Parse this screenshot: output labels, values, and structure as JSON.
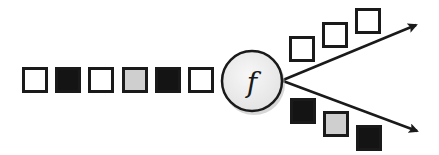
{
  "diagram": {
    "colors": {
      "white": "#ffffff",
      "black": "#141414",
      "gray": "#cfcfcf",
      "stroke": "#1a1a1a",
      "node_fill": "#efefef",
      "node_shadow": "#bdbdbd"
    },
    "input_stream": [
      {
        "color": "white",
        "x": 22,
        "y": 67
      },
      {
        "color": "black",
        "x": 55,
        "y": 67
      },
      {
        "color": "white",
        "x": 88,
        "y": 67
      },
      {
        "color": "gray",
        "x": 122,
        "y": 67
      },
      {
        "color": "black",
        "x": 155,
        "y": 67
      },
      {
        "color": "white",
        "x": 188,
        "y": 67
      }
    ],
    "function_node": {
      "label": "f",
      "cx": 252,
      "cy": 81,
      "r": 30
    },
    "output_streams": [
      {
        "name": "upper",
        "arrow": {
          "x1": 283,
          "y1": 80,
          "x2": 416,
          "y2": 25
        },
        "tokens": [
          {
            "color": "white",
            "x": 289,
            "y": 36
          },
          {
            "color": "white",
            "x": 322,
            "y": 22
          },
          {
            "color": "white",
            "x": 355,
            "y": 8
          }
        ]
      },
      {
        "name": "lower",
        "arrow": {
          "x1": 283,
          "y1": 81,
          "x2": 417,
          "y2": 131
        },
        "tokens": [
          {
            "color": "black",
            "x": 290,
            "y": 98
          },
          {
            "color": "gray",
            "x": 323,
            "y": 111
          },
          {
            "color": "black",
            "x": 356,
            "y": 125
          }
        ]
      }
    ],
    "token_size": 26
  }
}
